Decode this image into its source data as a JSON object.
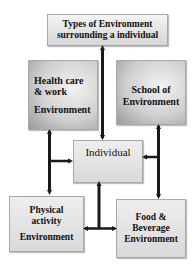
{
  "diagram": {
    "title_node": {
      "line1": "Types of Environment",
      "line2": "surrounding a individual"
    },
    "nodes": [
      {
        "id": "health",
        "lines": [
          "Health care",
          "& work",
          "Environment"
        ]
      },
      {
        "id": "school",
        "lines": [
          "School of",
          "Environment"
        ]
      },
      {
        "id": "individual",
        "lines": [
          "Individual"
        ]
      },
      {
        "id": "physical",
        "lines": [
          "Physical",
          "activity",
          "Environment"
        ]
      },
      {
        "id": "food",
        "lines": [
          "Food &",
          "Beverage",
          "Environment"
        ]
      }
    ],
    "edges": [
      {
        "from": "title",
        "to": "individual",
        "style": "double-arrow"
      },
      {
        "from": "health",
        "to": "physical",
        "style": "double-arrow"
      },
      {
        "from": "health-physical-connector",
        "to": "individual",
        "style": "arrow"
      },
      {
        "from": "school",
        "to": "food",
        "style": "double-arrow"
      },
      {
        "from": "school-food-connector",
        "to": "individual",
        "style": "arrow"
      },
      {
        "from": "individual",
        "to": "bottom-connector",
        "style": "arrow"
      },
      {
        "from": "bottom-connector",
        "to": "physical",
        "style": "arrow"
      },
      {
        "from": "bottom-connector",
        "to": "food",
        "style": "arrow"
      }
    ],
    "colors": {
      "line": "#1a1a1a",
      "box_border": "#a8a8a8",
      "text": "#111111"
    }
  }
}
